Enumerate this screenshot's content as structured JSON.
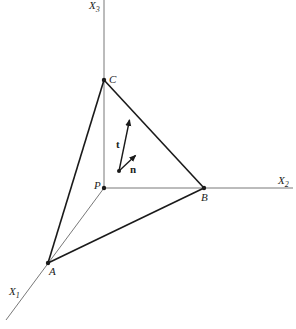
{
  "diagram": {
    "axes": {
      "x1": {
        "label": "X",
        "sub": "1"
      },
      "x2": {
        "label": "X",
        "sub": "2"
      },
      "x3": {
        "label": "X",
        "sub": "3"
      }
    },
    "points": {
      "P": {
        "label": "P",
        "x": 104,
        "y": 188
      },
      "A": {
        "label": "A",
        "x": 48,
        "y": 263
      },
      "B": {
        "label": "B",
        "x": 204,
        "y": 188
      },
      "C": {
        "label": "C",
        "x": 104,
        "y": 80
      }
    },
    "vectors": {
      "t": {
        "label": "t",
        "from": [
          119,
          171
        ],
        "to": [
          130,
          118
        ]
      },
      "n": {
        "label": "n",
        "from": [
          119,
          171
        ],
        "to": [
          137,
          154
        ]
      }
    },
    "colors": {
      "line": "#1a1a1a",
      "axis": "#444444",
      "background": "#ffffff"
    }
  }
}
